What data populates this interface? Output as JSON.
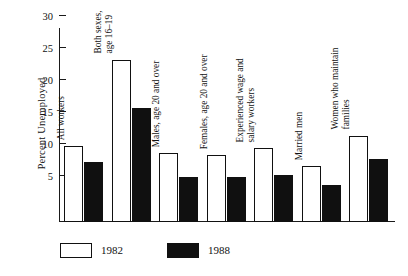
{
  "chart_data": {
    "type": "bar",
    "title": "",
    "xlabel": "",
    "ylabel": "Percent Unemployed",
    "ylim": [
      0,
      32
    ],
    "yticks": [
      5,
      10,
      15,
      20,
      25,
      30
    ],
    "grid": false,
    "legend_position": "bottom-left",
    "categories": [
      "All workers",
      "Both sexes,\nage 16–19",
      "Males, age 20 and over",
      "Females, age 20 and over",
      "Experienced wage and\nsalary workers",
      "Married men",
      "Women who maintain\nfamilies"
    ],
    "series": [
      {
        "name": "1982",
        "color": "#ffffff",
        "values": [
          9.7,
          23.2,
          8.6,
          8.3,
          9.3,
          6.5,
          11.3
        ]
      },
      {
        "name": "1988",
        "color": "#101010",
        "values": [
          7.2,
          15.6,
          4.8,
          4.9,
          5.2,
          3.6,
          7.6
        ]
      }
    ]
  },
  "categories_display": [
    {
      "lines": [
        "All workers"
      ]
    },
    {
      "lines": [
        "Both sexes,",
        "age 16–19"
      ]
    },
    {
      "lines": [
        "Males, age 20 and over"
      ]
    },
    {
      "lines": [
        "Females, age 20 and over"
      ]
    },
    {
      "lines": [
        "Experienced wage and",
        "salary workers"
      ]
    },
    {
      "lines": [
        "Married men"
      ]
    },
    {
      "lines": [
        "Women who maintain",
        "families"
      ]
    }
  ],
  "axis": {
    "y_label": "Percent Unemployed",
    "tick_labels": [
      "30",
      "25",
      "20",
      "15",
      "10",
      "5"
    ]
  },
  "legend": {
    "items": [
      {
        "label": "1982",
        "swatch": "white-box"
      },
      {
        "label": "1988",
        "swatch": "black-box"
      }
    ]
  }
}
